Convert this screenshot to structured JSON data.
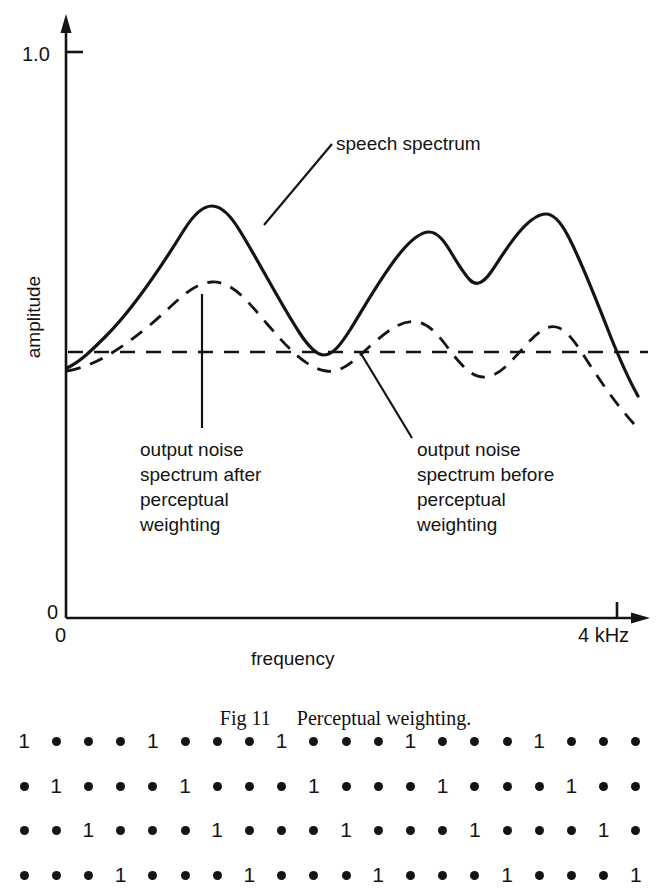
{
  "figure": {
    "caption_number": "Fig 11",
    "caption_text": "Perceptual weighting."
  },
  "chart_data": {
    "type": "line",
    "title": "",
    "xlabel": "frequency",
    "ylabel": "amplitude",
    "xlim": [
      0,
      4
    ],
    "ylim": [
      0,
      1.0
    ],
    "x_tick_labels": [
      "0",
      "4 kHz"
    ],
    "y_tick_labels": [
      "0",
      "1.0"
    ],
    "grid": false,
    "legend": "annotations",
    "series": [
      {
        "name": "speech spectrum",
        "style": "solid",
        "color": "#141414",
        "x": [
          0.0,
          0.18,
          0.4,
          0.62,
          0.86,
          1.08,
          1.28,
          1.5,
          1.72,
          1.92,
          2.08,
          2.24,
          2.42,
          2.6,
          2.78,
          2.94,
          3.1,
          3.28,
          3.48,
          3.68,
          3.86,
          4.0
        ],
        "y": [
          0.38,
          0.44,
          0.54,
          0.66,
          0.76,
          0.8,
          0.74,
          0.62,
          0.5,
          0.41,
          0.44,
          0.55,
          0.64,
          0.66,
          0.61,
          0.58,
          0.64,
          0.68,
          0.64,
          0.55,
          0.44,
          0.34
        ]
      },
      {
        "name": "output noise spectrum after perceptual weighting",
        "style": "dashed",
        "color": "#141414",
        "x": [
          0.0,
          0.2,
          0.44,
          0.7,
          0.96,
          1.18,
          1.4,
          1.62,
          1.86,
          2.08,
          2.3,
          2.52,
          2.72,
          2.92,
          3.12,
          3.32,
          3.54,
          3.76,
          4.0
        ],
        "y": [
          0.34,
          0.38,
          0.44,
          0.51,
          0.56,
          0.54,
          0.49,
          0.43,
          0.39,
          0.41,
          0.47,
          0.48,
          0.44,
          0.41,
          0.45,
          0.47,
          0.42,
          0.36,
          0.29
        ]
      },
      {
        "name": "output noise spectrum before perceptual weighting",
        "style": "dashed-flat",
        "color": "#141414",
        "x": [
          0.02,
          4.05
        ],
        "y": [
          0.455,
          0.455
        ]
      }
    ],
    "annotations": [
      {
        "text": "speech spectrum",
        "points_to": "solid curve descending flank of first peak"
      },
      {
        "text": "output noise spectrum after perceptual weighting",
        "points_to": "first peak of dashed noise curve"
      },
      {
        "text": "output noise spectrum before perceptual weighting",
        "points_to": "flat dashed noise line"
      }
    ]
  },
  "labels": {
    "speech_spectrum": "speech spectrum",
    "noise_after": "output noise\nspectrum after\nperceptual\nweighting",
    "noise_before": "output noise\nspectrum before\nperceptual\nweighting",
    "y_axis_title": "amplitude",
    "x_axis_title": "frequency",
    "y_max": "1.0",
    "y_zero": "0",
    "x_zero": "0",
    "x_max": "4 kHz"
  },
  "bit_grid": {
    "rows": 4,
    "columns": 20,
    "one_value": "1",
    "dot_value": "•",
    "pattern": [
      [
        "1",
        "•",
        "•",
        "•",
        "1",
        "•",
        "•",
        "•",
        "1",
        "•",
        "•",
        "•",
        "1",
        "•",
        "•",
        "•",
        "1",
        "•",
        "•",
        "•"
      ],
      [
        "•",
        "1",
        "•",
        "•",
        "•",
        "1",
        "•",
        "•",
        "•",
        "1",
        "•",
        "•",
        "•",
        "1",
        "•",
        "•",
        "•",
        "1",
        "•",
        "•"
      ],
      [
        "•",
        "•",
        "1",
        "•",
        "•",
        "•",
        "1",
        "•",
        "•",
        "•",
        "1",
        "•",
        "•",
        "•",
        "1",
        "•",
        "•",
        "•",
        "1",
        "•"
      ],
      [
        "•",
        "•",
        "•",
        "1",
        "•",
        "•",
        "•",
        "1",
        "•",
        "•",
        "•",
        "1",
        "•",
        "•",
        "•",
        "1",
        "•",
        "•",
        "•",
        "1"
      ]
    ]
  },
  "colors": {
    "ink": "#141414",
    "page": "#ffffff"
  }
}
